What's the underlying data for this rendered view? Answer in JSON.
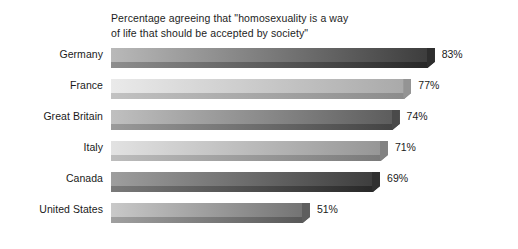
{
  "chart_data": {
    "type": "bar",
    "orientation": "horizontal",
    "title": "Percentage agreeing that \"homosexuality is a way\nof life that should be accepted by society\"",
    "xlabel": "",
    "ylabel": "",
    "xlim": [
      0,
      100
    ],
    "grid": false,
    "legend": false,
    "categories": [
      "Germany",
      "France",
      "Great Britain",
      "Italy",
      "Canada",
      "United States"
    ],
    "values": [
      83,
      77,
      74,
      71,
      69,
      51
    ],
    "value_labels": [
      "83%",
      "77%",
      "74%",
      "71%",
      "69%",
      "51%"
    ],
    "bars": [
      {
        "category": "Germany",
        "value": 83,
        "label": "83%",
        "fill_start": "#b9b9b9",
        "fill_end": "#3a3a3a",
        "bevel_start": "#8e8e8e",
        "bevel_end": "#252525",
        "cap_color": "#2e2e2e"
      },
      {
        "category": "France",
        "value": 77,
        "label": "77%",
        "fill_start": "#eaeaea",
        "fill_end": "#a8a8a8",
        "bevel_start": "#c2c2c2",
        "bevel_end": "#8a8a8a",
        "cap_color": "#949494"
      },
      {
        "category": "Great Britain",
        "value": 74,
        "label": "74%",
        "fill_start": "#c0c0c0",
        "fill_end": "#5a5a5a",
        "bevel_start": "#9a9a9a",
        "bevel_end": "#414141",
        "cap_color": "#4a4a4a"
      },
      {
        "category": "Italy",
        "value": 71,
        "label": "71%",
        "fill_start": "#e2e2e2",
        "fill_end": "#949494",
        "bevel_start": "#bdbdbd",
        "bevel_end": "#787878",
        "cap_color": "#828282"
      },
      {
        "category": "Canada",
        "value": 69,
        "label": "69%",
        "fill_start": "#9e9e9e",
        "fill_end": "#3b3b3b",
        "bevel_start": "#7a7a7a",
        "bevel_end": "#262626",
        "cap_color": "#303030"
      },
      {
        "category": "United States",
        "value": 51,
        "label": "51%",
        "fill_start": "#c9c9c9",
        "fill_end": "#707070",
        "bevel_start": "#a0a0a0",
        "bevel_end": "#555555",
        "cap_color": "#5e5e5e"
      }
    ]
  }
}
